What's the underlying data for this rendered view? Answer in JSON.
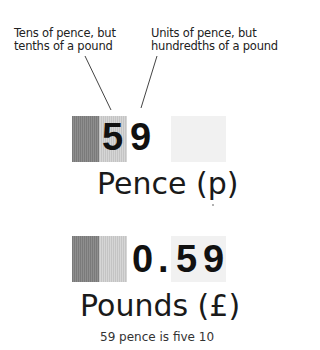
{
  "annotations": {
    "left": {
      "line1": "Tens of pence, but",
      "line2": "tenths of a pound"
    },
    "right": {
      "line1": "Units of pence, but",
      "line2": "hundredths of a pound"
    }
  },
  "pence_row": {
    "digits": [
      "5",
      "9"
    ],
    "caption": "Pence (p)"
  },
  "pounds_row": {
    "digits": [
      "0",
      ".",
      "5",
      "9"
    ],
    "caption": "Pounds (£)"
  },
  "footer": "59 pence is five 10",
  "colors": {
    "dark_box": "#858585",
    "light_box": "#cdcdcd",
    "pale_box": "#f1f1f1"
  }
}
